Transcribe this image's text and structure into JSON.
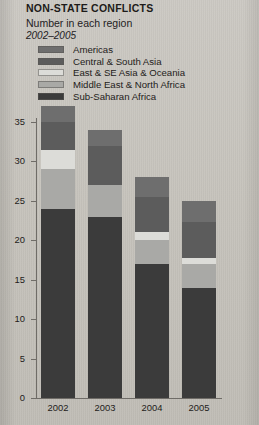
{
  "header": {
    "title": "NON-STATE CONFLICTS",
    "subtitle": "Number in each region",
    "years": "2002–2005"
  },
  "legend": {
    "items": [
      {
        "label": "Americas",
        "color": "#6e6e6e"
      },
      {
        "label": "Central & South Asia",
        "color": "#5c5c5c"
      },
      {
        "label": "East & SE Asia & Oceania",
        "color": "#dcdcd8"
      },
      {
        "label": "Middle East & North Africa",
        "color": "#a9a9a6"
      },
      {
        "label": "Sub-Saharan Africa",
        "color": "#3b3b3b"
      }
    ]
  },
  "chart_data": {
    "type": "bar",
    "title": "NON-STATE CONFLICTS",
    "subtitle": "Number in each region",
    "period": "2002–2005",
    "stacked": true,
    "xlabel": "",
    "ylabel": "",
    "ylim": [
      0,
      35
    ],
    "ytick_step": 5,
    "grid": false,
    "legend_position": "top",
    "categories": [
      "2002",
      "2003",
      "2004",
      "2005"
    ],
    "ytick_labels": [
      "0",
      "5",
      "10",
      "15",
      "20",
      "25",
      "30",
      "35"
    ],
    "series": [
      {
        "name": "Sub-Saharan Africa",
        "color": "#3b3b3b",
        "values": [
          24,
          23,
          17,
          14
        ]
      },
      {
        "name": "Middle East & North Africa",
        "color": "#a9a9a6",
        "values": [
          5,
          4,
          3,
          3
        ]
      },
      {
        "name": "East & SE Asia & Oceania",
        "color": "#dcdcd8",
        "values": [
          2.5,
          0,
          1,
          0.8
        ]
      },
      {
        "name": "Central & South Asia",
        "color": "#5c5c5c",
        "values": [
          3.5,
          5,
          4.5,
          4.5
        ]
      },
      {
        "name": "Americas",
        "color": "#6e6e6e",
        "values": [
          2,
          2,
          2.5,
          2.7
        ]
      }
    ],
    "totals": [
      37,
      34,
      28,
      25
    ]
  }
}
